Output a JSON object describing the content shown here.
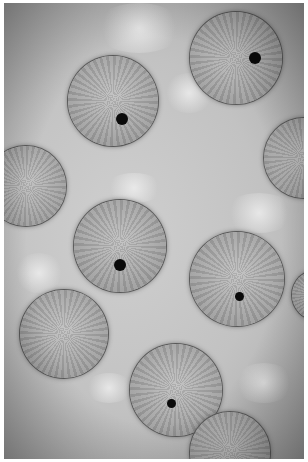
{
  "image": {
    "description": "Grayscale phase-contrast micrograph of round cells with radial texture; several cells marked with black dots",
    "cells": [
      {
        "x": 68,
        "y": 56,
        "d": 90,
        "marker": {
          "x": 122,
          "y": 119
        }
      },
      {
        "x": 190,
        "y": 12,
        "d": 92,
        "marker": {
          "x": 255,
          "y": 58
        }
      },
      {
        "x": 264,
        "y": 118,
        "d": 80,
        "marker": null
      },
      {
        "x": -14,
        "y": 146,
        "d": 80,
        "marker": null
      },
      {
        "x": 74,
        "y": 200,
        "d": 92,
        "marker": {
          "x": 120,
          "y": 265
        }
      },
      {
        "x": 190,
        "y": 232,
        "d": 94,
        "marker": {
          "x": 239,
          "y": 296,
          "small": true
        }
      },
      {
        "x": 20,
        "y": 290,
        "d": 88,
        "marker": null
      },
      {
        "x": 130,
        "y": 344,
        "d": 92,
        "marker": {
          "x": 171,
          "y": 403,
          "small": true
        }
      },
      {
        "x": 292,
        "y": 270,
        "d": 50,
        "marker": null
      },
      {
        "x": 190,
        "y": 412,
        "d": 80,
        "marker": null
      }
    ]
  }
}
